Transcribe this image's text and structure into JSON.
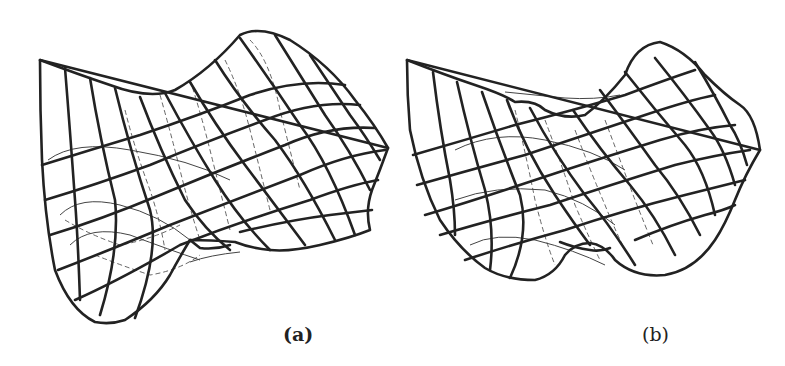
{
  "figure": {
    "panels": [
      {
        "id": "a",
        "caption": "(a)",
        "description": "wireframe surface plot of double-well potential"
      },
      {
        "id": "b",
        "caption": "(b)",
        "description": "wireframe surface plot of double-well potential"
      }
    ],
    "colors": {
      "line": "#222222",
      "background": "#ffffff"
    }
  }
}
